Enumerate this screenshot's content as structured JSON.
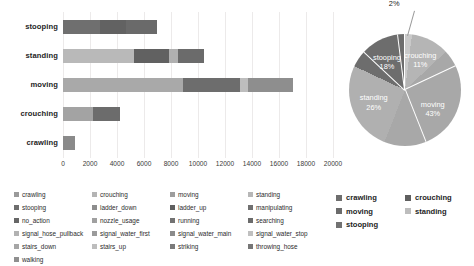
{
  "chart_data": [
    {
      "type": "bar",
      "orientation": "horizontal",
      "stacked": true,
      "title": "",
      "xlabel": "",
      "ylabel": "",
      "xlim": [
        0,
        20000
      ],
      "xticks": [
        "0",
        "2000",
        "4000",
        "6000",
        "8000",
        "10000",
        "12000",
        "14000",
        "16000",
        "18000",
        "20000"
      ],
      "grid": true,
      "categories": [
        "crawling",
        "crouching",
        "moving",
        "standing",
        "stooping"
      ],
      "category_order_top_to_bottom": [
        "stooping",
        "standing",
        "moving",
        "crouching",
        "crawling"
      ],
      "bars": [
        {
          "category": "stooping",
          "total": 6950,
          "segments": [
            {
              "label": "crawling",
              "value": 2750,
              "color": "#6f6f6f"
            },
            {
              "label": "crouching",
              "value": 1900,
              "color": "#626262"
            },
            {
              "label": "moving",
              "value": 2300,
              "color": "#6a6a6a"
            }
          ]
        },
        {
          "category": "standing",
          "total": 10450,
          "segments": [
            {
              "label": "crawling",
              "value": 5250,
              "color": "#b9b9b9"
            },
            {
              "label": "crouching",
              "value": 2600,
              "color": "#616161"
            },
            {
              "label": "moving",
              "value": 700,
              "color": "#b0b0b0"
            },
            {
              "label": "standing",
              "value": 1900,
              "color": "#6b6b6b"
            }
          ]
        },
        {
          "category": "moving",
          "total": 17050,
          "segments": [
            {
              "label": "crawling",
              "value": 8900,
              "color": "#a9a9a9"
            },
            {
              "label": "crouching",
              "value": 4200,
              "color": "#6d6d6d"
            },
            {
              "label": "moving",
              "value": 600,
              "color": "#bdbdbd"
            },
            {
              "label": "standing",
              "value": 3350,
              "color": "#8e8e8e"
            }
          ]
        },
        {
          "category": "crouching",
          "total": 4200,
          "segments": [
            {
              "label": "crawling",
              "value": 2200,
              "color": "#a3a3a3"
            },
            {
              "label": "crouching",
              "value": 2000,
              "color": "#6c6c6c"
            }
          ]
        },
        {
          "category": "crawling",
          "total": 900,
          "segments": [
            {
              "label": "crawling",
              "value": 900,
              "color": "#8a8a8a"
            }
          ]
        }
      ],
      "legend": {
        "position": "bottom",
        "entries": [
          {
            "label": "crawling",
            "color": "#9a9a9a"
          },
          {
            "label": "crouching",
            "color": "#b4b4b4"
          },
          {
            "label": "moving",
            "color": "#9d9d9d"
          },
          {
            "label": "standing",
            "color": "#b7b7b7"
          },
          {
            "label": "stooping",
            "color": "#6e6e6e"
          },
          {
            "label": "ladder_down",
            "color": "#8d8d8d"
          },
          {
            "label": "ladder_up",
            "color": "#5f5f5f"
          },
          {
            "label": "manipulating",
            "color": "#707070"
          },
          {
            "label": "no_action",
            "color": "#666666"
          },
          {
            "label": "nozzle_usage",
            "color": "#a0a0a0"
          },
          {
            "label": "running",
            "color": "#727272"
          },
          {
            "label": "searching",
            "color": "#6b6b6b"
          },
          {
            "label": "signal_hose_pullback",
            "color": "#b2b2b2"
          },
          {
            "label": "signal_water_first",
            "color": "#9b9b9b"
          },
          {
            "label": "signal_water_main",
            "color": "#8b8b8b"
          },
          {
            "label": "signal_water_stop",
            "color": "#c0c0c0"
          },
          {
            "label": "stairs_down",
            "color": "#a6a6a6"
          },
          {
            "label": "stairs_up",
            "color": "#bdbdbd"
          },
          {
            "label": "striking",
            "color": "#7a7a7a"
          },
          {
            "label": "throwing_hose",
            "color": "#767676"
          },
          {
            "label": "walking",
            "color": "#8f8f8f"
          }
        ]
      }
    },
    {
      "type": "pie",
      "title": "",
      "labels": [
        "crawling",
        "crouching",
        "moving",
        "standing",
        "stooping"
      ],
      "values": [
        2,
        11,
        43,
        26,
        18
      ],
      "unit": "%",
      "slices": [
        {
          "label": "crawling",
          "pct": "2%",
          "value": 2,
          "color": "#c9c9c9",
          "label_position": "outside"
        },
        {
          "label": "crouching",
          "pct": "11%",
          "value": 11,
          "color": "#b5b5b5",
          "label_position": "inside"
        },
        {
          "label": "moving",
          "pct": "43%",
          "value": 43,
          "color": "#a8a8a8",
          "label_position": "inside"
        },
        {
          "label": "standing",
          "pct": "26%",
          "value": 26,
          "color": "#b0b0b0",
          "label_position": "inside"
        },
        {
          "label": "stooping",
          "pct": "18%",
          "value": 18,
          "color": "#6d6d6d",
          "label_position": "inside"
        }
      ],
      "legend": {
        "position": "bottom",
        "entries": [
          {
            "label": "crawling",
            "color": "#6e6e6e"
          },
          {
            "label": "crouching",
            "color": "#5f5f5f"
          },
          {
            "label": "moving",
            "color": "#6b6b6b"
          },
          {
            "label": "standing",
            "color": "#bdbdbd"
          },
          {
            "label": "stooping",
            "color": "#727272"
          }
        ]
      }
    }
  ]
}
